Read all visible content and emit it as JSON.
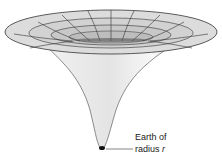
{
  "diagram": {
    "type": "gravity-well funnel",
    "label_line1": "Earth of",
    "label_line2": "radius ",
    "label_var": "r",
    "colors": {
      "surface": "#d9d9d9",
      "funnel": "#eaeaea",
      "line": "#333333",
      "mass": "#111111"
    }
  }
}
